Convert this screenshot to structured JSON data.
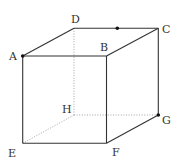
{
  "diagram": {
    "type": "cube",
    "colors": {
      "edge": "#333333",
      "hidden_edge": "#9a9a9a",
      "point": "#111111",
      "label": "#333333"
    },
    "vertices": [
      {
        "name": "A",
        "x": 22.7,
        "y": 56,
        "lx": 9,
        "ly": 60
      },
      {
        "name": "B",
        "x": 106.5,
        "y": 56,
        "lx": 100,
        "ly": 51
      },
      {
        "name": "C",
        "x": 158.3,
        "y": 28.3,
        "lx": 162,
        "ly": 33
      },
      {
        "name": "D",
        "x": 74,
        "y": 28.3,
        "lx": 71,
        "ly": 23
      },
      {
        "name": "E",
        "x": 22.7,
        "y": 143.3,
        "lx": 8,
        "ly": 157
      },
      {
        "name": "F",
        "x": 106.5,
        "y": 143.3,
        "lx": 112,
        "ly": 156
      },
      {
        "name": "G",
        "x": 158.3,
        "y": 115,
        "lx": 162,
        "ly": 124
      },
      {
        "name": "H",
        "x": 74,
        "y": 115,
        "lx": 62,
        "ly": 113
      }
    ],
    "labels": {
      "A": "A",
      "B": "B",
      "C": "C",
      "D": "D",
      "E": "E",
      "F": "F",
      "G": "G",
      "H": "H"
    },
    "visible_edges": [
      "AB",
      "BC",
      "CD",
      "DA",
      "AE",
      "BF",
      "CG",
      "EF",
      "FG"
    ],
    "hidden_edges": [
      "DH",
      "EH",
      "HG"
    ],
    "marked_points": [
      {
        "name": "A",
        "x": 22.7,
        "y": 56
      },
      {
        "name": "point-on-DC",
        "x": 117.3,
        "y": 28.3
      },
      {
        "name": "G",
        "x": 158.3,
        "y": 115
      }
    ]
  }
}
